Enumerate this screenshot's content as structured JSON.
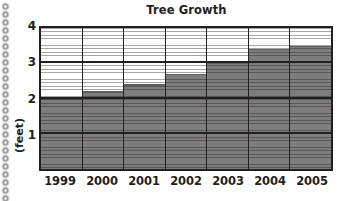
{
  "page": {
    "background_color": "#ffffff",
    "ink_color": "#231f20",
    "margin_decoration": {
      "name": "notebook-punch-holes",
      "dot_count": 25,
      "dot_spacing_px": 8,
      "first_dot_y": 3
    }
  },
  "chart_data": {
    "type": "bar",
    "title": "Tree Growth",
    "xlabel": "",
    "ylabel": "(feet)",
    "categories": [
      "1999",
      "2000",
      "2001",
      "2002",
      "2003",
      "2004",
      "2005"
    ],
    "values": [
      2,
      2.2,
      2.4,
      2.7,
      3,
      3.4,
      3.5
    ],
    "ylim": [
      0,
      4
    ],
    "ytick_labels": [
      "4",
      "3",
      "2",
      "1"
    ],
    "ytick_values": [
      4,
      3,
      2,
      1
    ],
    "gridlines": [
      1,
      2,
      3
    ],
    "grid": true,
    "legend": "none",
    "series": [
      {
        "name": "Tree Growth",
        "values": [
          2,
          2.2,
          2.4,
          2.7,
          3,
          3.4,
          3.5
        ],
        "bar_color": "#7d7d7d",
        "texture": "horizontal-stripes"
      }
    ]
  },
  "colors": {
    "bar_fill": "#7d7d7d",
    "axis_line": "#231f20",
    "plot_background": "#ffffff",
    "stripe": "#231f20"
  }
}
